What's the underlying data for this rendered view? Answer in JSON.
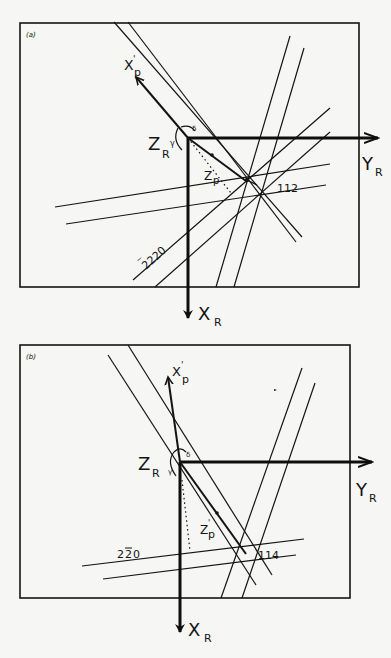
{
  "panels": [
    {
      "id": "a",
      "tag": "(a)",
      "axes": {
        "y": "Y",
        "y_sub": "R",
        "x": "X",
        "x_sub": "R",
        "z": "Z",
        "z_sub": "R",
        "xp": "X",
        "xp_prime": "'",
        "xp_sub": "p",
        "zp": "Z",
        "zp_sub": "p"
      },
      "angles": {
        "gamma": "γ",
        "delta": "δ"
      },
      "reflections": [
        "112",
        "2̄20"
      ],
      "reflection_labels": {
        "r1": "112",
        "r2_bar": "‾",
        "r2": "220"
      }
    },
    {
      "id": "b",
      "tag": "(b)",
      "axes": {
        "y": "Y",
        "y_sub": "R",
        "x": "X",
        "x_sub": "R",
        "z": "Z",
        "z_sub": "R",
        "xp": "X",
        "xp_prime": "'",
        "xp_sub": "p",
        "zp": "Z",
        "zp_prime": "'",
        "zp_sub": "p"
      },
      "angles": {
        "gamma": "γ",
        "delta": "δ"
      },
      "reflections": [
        "114",
        "22̄0"
      ],
      "reflection_labels": {
        "r1": "114",
        "r2_a": "2",
        "r2_bar": "2",
        "r2_b": "0"
      }
    }
  ],
  "colors": {
    "ink": "#141414",
    "paper": "#f6f6f4"
  }
}
